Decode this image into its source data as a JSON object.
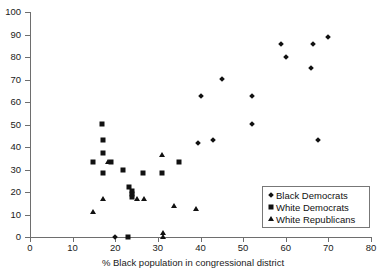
{
  "chart_data": {
    "type": "scatter",
    "title": "",
    "xlabel": "% Black population in congressional district",
    "ylabel": "",
    "xlim": [
      0,
      80
    ],
    "ylim": [
      0,
      100
    ],
    "xticks": [
      0,
      10,
      20,
      30,
      40,
      50,
      60,
      70,
      80
    ],
    "yticks": [
      0,
      10,
      20,
      30,
      40,
      50,
      60,
      70,
      80,
      90,
      100
    ],
    "grid": false,
    "legend_position": "lower-right",
    "series": [
      {
        "name": "Black Democrats",
        "marker": "diamond",
        "color": "#111111",
        "points": [
          [
            20.0,
            0.0
          ],
          [
            39.5,
            41.8
          ],
          [
            40.0,
            62.6
          ],
          [
            43.0,
            43.0
          ],
          [
            45.0,
            70.2
          ],
          [
            52.0,
            50.3
          ],
          [
            52.0,
            62.6
          ],
          [
            59.0,
            86.0
          ],
          [
            60.0,
            80.2
          ],
          [
            66.0,
            75.2
          ],
          [
            66.5,
            86.0
          ],
          [
            67.5,
            43.0
          ],
          [
            70.0,
            89.0
          ]
        ]
      },
      {
        "name": "White Democrats",
        "marker": "square",
        "color": "#111111",
        "points": [
          [
            14.8,
            33.3
          ],
          [
            17.0,
            50.2
          ],
          [
            17.2,
            42.9
          ],
          [
            17.2,
            37.5
          ],
          [
            17.2,
            28.5
          ],
          [
            19.0,
            33.3
          ],
          [
            21.8,
            30.0
          ],
          [
            23.0,
            0.0
          ],
          [
            23.2,
            22.3
          ],
          [
            23.9,
            20.5
          ],
          [
            23.9,
            19.0
          ],
          [
            23.9,
            17.6
          ],
          [
            26.5,
            28.5
          ],
          [
            31.0,
            28.5
          ],
          [
            35.0,
            33.4
          ]
        ]
      },
      {
        "name": "White Republicans",
        "marker": "triangle",
        "color": "#111111",
        "points": [
          [
            14.8,
            11.2
          ],
          [
            17.2,
            16.7
          ],
          [
            18.3,
            33.3
          ],
          [
            25.2,
            16.9
          ],
          [
            26.8,
            16.9
          ],
          [
            31.0,
            36.6
          ],
          [
            31.2,
            0.0
          ],
          [
            31.2,
            2.0
          ],
          [
            33.8,
            13.7
          ],
          [
            39.0,
            12.6
          ]
        ]
      }
    ]
  },
  "legend": {
    "items": [
      {
        "label": "Black Democrats",
        "marker": "diamond"
      },
      {
        "label": "White Democrats",
        "marker": "square"
      },
      {
        "label": "White Republicans",
        "marker": "triangle"
      }
    ]
  }
}
